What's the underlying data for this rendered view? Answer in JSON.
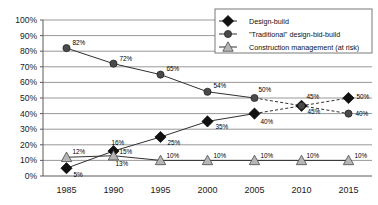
{
  "chart_data": {
    "type": "line",
    "title": "",
    "subtitle": "",
    "xlabel": "",
    "ylabel": "",
    "categories": [
      "1985",
      "1990",
      "1995",
      "2000",
      "2005",
      "2010",
      "2015"
    ],
    "ylim": [
      0,
      100
    ],
    "yticks": [
      "0%",
      "10%",
      "20%",
      "30%",
      "40%",
      "50%",
      "60%",
      "70%",
      "80%",
      "90%",
      "100%"
    ],
    "ytick_values": [
      0,
      10,
      20,
      30,
      40,
      50,
      60,
      70,
      80,
      90,
      100
    ],
    "grid": true,
    "legend_position": "top-right",
    "series": [
      {
        "name": "Design-build",
        "marker": "diamond",
        "values": [
          5,
          16,
          25,
          35,
          40,
          45,
          50
        ],
        "labels": [
          "5%",
          "16%",
          "25%",
          "35%",
          "40%",
          "45%",
          "50%"
        ],
        "dashed_from_index": 4
      },
      {
        "name": "\"Traditional\" design-bid-build",
        "marker": "circle",
        "values": [
          82,
          72,
          65,
          54,
          50,
          45,
          40
        ],
        "labels": [
          "82%",
          "72%",
          "65%",
          "54%",
          "50%",
          "45%",
          "40%"
        ],
        "dashed_from_index": 4
      },
      {
        "name": "Construction management (at risk)",
        "marker": "triangle",
        "values": [
          12,
          13,
          10,
          10,
          10,
          10,
          10
        ],
        "labels": [
          "12%",
          "13%",
          "10%",
          "10%",
          "10%",
          "10%",
          "10%"
        ],
        "dashed_from_index": null
      }
    ],
    "annotations": [
      {
        "text": "15%",
        "series": "Construction management (at risk)",
        "near": "1990"
      }
    ]
  },
  "legend": {
    "entries": [
      {
        "label": "Design-build",
        "marker": "diamond"
      },
      {
        "label": "\"Traditional\" design-bid-build",
        "marker": "circle"
      },
      {
        "label": "Construction management (at risk)",
        "marker": "triangle"
      }
    ]
  },
  "extra_labels": {
    "cm_1990_upper": "15%"
  }
}
